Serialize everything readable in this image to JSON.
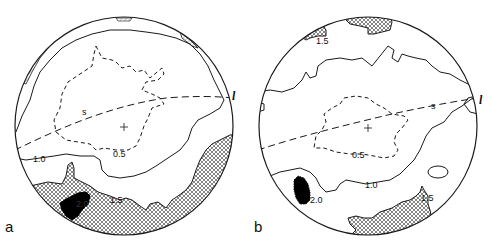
{
  "figure": {
    "type": "stereonet-contour-diagram",
    "panels": [
      {
        "id": "a",
        "panel_label": "a",
        "lineation_label": "l",
        "great_circle_label": "s",
        "contour_labels": [
          "0.5",
          "1.0",
          "1.5",
          "2.0"
        ],
        "center_marker": "+"
      },
      {
        "id": "b",
        "panel_label": "b",
        "lineation_label": "l",
        "great_circle_label": "s",
        "contour_labels": [
          "0.5",
          "1.0",
          "1.5",
          "1.5",
          "2.0"
        ],
        "center_marker": "+"
      }
    ],
    "legend_hint": {
      "dashed": "0.5",
      "solid": "1.0",
      "crosshatch": ">1.5",
      "black": ">2.0"
    },
    "colors": {
      "line": "#1a1a1a",
      "fill_black": "#000000",
      "background": "#ffffff"
    }
  }
}
